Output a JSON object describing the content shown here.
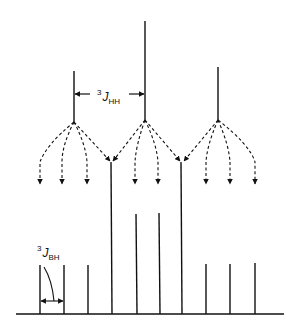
{
  "diagram": {
    "type": "nmr-splitting-tree",
    "colors": {
      "ink": "#111111",
      "background": "#ffffff"
    },
    "labels": {
      "jhh_sup": "3",
      "jhh_main": "J",
      "jhh_sub": "HH",
      "jbh_sup": "3",
      "jbh_main": "J",
      "jbh_sub": "BH"
    },
    "top_multiplet": [
      {
        "x": 74,
        "y_top": 71,
        "y_bottom": 122
      },
      {
        "x": 145,
        "y_top": 21,
        "y_bottom": 120
      },
      {
        "x": 218,
        "y_top": 67,
        "y_bottom": 120
      }
    ],
    "bottom_multiplet": [
      {
        "x": 40,
        "height": 49
      },
      {
        "x": 64,
        "height": 49
      },
      {
        "x": 88,
        "height": 49
      },
      {
        "x": 112,
        "height": 152
      },
      {
        "x": 136,
        "height": 100
      },
      {
        "x": 159,
        "height": 101
      },
      {
        "x": 182,
        "height": 152
      },
      {
        "x": 206,
        "height": 50
      },
      {
        "x": 230,
        "height": 50
      },
      {
        "x": 255,
        "height": 51
      }
    ],
    "baseline": {
      "y": 314,
      "x1": 16,
      "x2": 284
    }
  }
}
